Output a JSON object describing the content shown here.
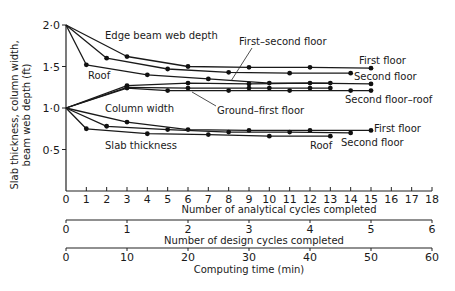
{
  "chart_data": {
    "type": "line",
    "title": "",
    "ylabel": "Slab thickness, column width, beam web depth (ft)",
    "xlabel": "Number of analytical cycles completed",
    "secondary_axes": [
      {
        "label": "Number of design cycles completed",
        "range": [
          0,
          6
        ],
        "ticks": [
          "0",
          "1",
          "2",
          "3",
          "4",
          "5",
          "6"
        ]
      },
      {
        "label": "Computing time (min)",
        "range": [
          0,
          60
        ],
        "ticks": [
          "0",
          "10",
          "20",
          "30",
          "40",
          "50",
          "60"
        ]
      }
    ],
    "xlim": [
      0,
      18
    ],
    "ylim": [
      0,
      2.0
    ],
    "x_ticks": [
      "0",
      "1",
      "2",
      "3",
      "4",
      "5",
      "6",
      "7",
      "8",
      "9",
      "10",
      "11",
      "12",
      "13",
      "14",
      "15",
      "16",
      "17",
      "18"
    ],
    "y_ticks": [
      "0·5",
      "1·0",
      "1·5",
      "2·0"
    ],
    "grid": false,
    "series": [
      {
        "group": "Edge beam web depth",
        "name": "First floor",
        "x": [
          0,
          3,
          6,
          9,
          12,
          15
        ],
        "y": [
          2.0,
          1.62,
          1.5,
          1.49,
          1.49,
          1.48
        ]
      },
      {
        "group": "Edge beam web depth",
        "name": "Second floor",
        "x": [
          0,
          2,
          5,
          8,
          11,
          14
        ],
        "y": [
          2.0,
          1.6,
          1.47,
          1.43,
          1.42,
          1.42
        ]
      },
      {
        "group": "Edge beam web depth",
        "name": "Roof",
        "x": [
          0,
          1,
          4,
          7,
          10,
          13
        ],
        "y": [
          2.0,
          1.52,
          1.4,
          1.35,
          1.3,
          1.3
        ]
      },
      {
        "group": "Column width",
        "name": "First-second floor",
        "x": [
          0,
          3,
          6,
          9,
          12,
          15
        ],
        "y": [
          1.0,
          1.27,
          1.3,
          1.29,
          1.3,
          1.29
        ]
      },
      {
        "group": "Column width",
        "name": "Ground-first floor",
        "x": [
          0,
          3,
          6,
          9,
          10,
          12,
          13
        ],
        "y": [
          1.0,
          1.25,
          1.24,
          1.24,
          1.24,
          1.24,
          1.24
        ]
      },
      {
        "group": "Column width",
        "name": "Second floor-roof",
        "x": [
          0,
          3,
          5,
          8,
          11,
          14,
          15
        ],
        "y": [
          1.0,
          1.24,
          1.21,
          1.21,
          1.21,
          1.21,
          1.21
        ]
      },
      {
        "group": "Slab thickness",
        "name": "First floor",
        "x": [
          0,
          3,
          6,
          9,
          12,
          15
        ],
        "y": [
          1.0,
          0.83,
          0.74,
          0.73,
          0.73,
          0.73
        ]
      },
      {
        "group": "Slab thickness",
        "name": "Second floor",
        "x": [
          0,
          2,
          5,
          8,
          11,
          14
        ],
        "y": [
          1.0,
          0.78,
          0.74,
          0.71,
          0.71,
          0.7
        ]
      },
      {
        "group": "Slab thickness",
        "name": "Roof",
        "x": [
          0,
          1,
          4,
          7,
          10,
          13
        ],
        "y": [
          1.0,
          0.75,
          0.69,
          0.68,
          0.66,
          0.66
        ]
      }
    ],
    "annotations": [
      "Edge beam web depth",
      "Roof",
      "First-second floor",
      "First floor",
      "Second floor",
      "Column width",
      "Ground-first floor",
      "Second floor-roof",
      "Slab thickness",
      "Roof",
      "First floor",
      "Second floor"
    ]
  },
  "labels": {
    "ylabel_line1": "Slab thickness, column width,",
    "ylabel_line2": "beam web depth (ft)",
    "x_axis_title": "Number of analytical cycles completed",
    "design_axis_title": "Number of design cycles completed",
    "time_axis_title": "Computing time (min)",
    "edge_beam": "Edge beam web depth",
    "roof_beam": "Roof",
    "first_second": "First–second floor",
    "first_floor_beam": "First floor",
    "second_floor_beam": "Second floor",
    "column_width": "Column width",
    "ground_first": "Ground–first floor",
    "second_roof": "Second floor–roof",
    "slab_thickness": "Slab thickness",
    "roof_slab": "Roof",
    "first_floor_slab": "First floor",
    "second_floor_slab": "Second floor"
  }
}
